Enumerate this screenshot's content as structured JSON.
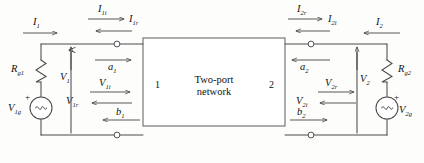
{
  "diagram": {
    "center_block": {
      "line1": "Two-port",
      "line2": "network",
      "port_left": "1",
      "port_right": "2"
    },
    "left_network": {
      "source_label_base": "V",
      "source_label_sub": "1g",
      "source_polarity": "+",
      "resistor_label_base": "R",
      "resistor_label_sub": "g1"
    },
    "right_network": {
      "source_label_base": "V",
      "source_label_sub": "2g",
      "source_polarity": "+",
      "resistor_label_base": "R",
      "resistor_label_sub": "g2"
    },
    "labels": {
      "I1": {
        "base": "I",
        "sub": "1",
        "arrow": "right"
      },
      "I1i": {
        "base": "I",
        "sub": "1i",
        "arrow": "right"
      },
      "I1r": {
        "base": "I",
        "sub": "1r",
        "arrow": "left"
      },
      "I2r": {
        "base": "I",
        "sub": "2r",
        "arrow": "right"
      },
      "I2i": {
        "base": "I",
        "sub": "2i",
        "arrow": "left"
      },
      "I2": {
        "base": "I",
        "sub": "2",
        "arrow": "left"
      },
      "V1": {
        "base": "V",
        "sub": "1",
        "arrow": "up"
      },
      "V1i": {
        "base": "V",
        "sub": "1i",
        "arrow": "right"
      },
      "V1r": {
        "base": "V",
        "sub": "1r",
        "arrow": "left"
      },
      "V2": {
        "base": "V",
        "sub": "2",
        "arrow": "up"
      },
      "V2r": {
        "base": "V",
        "sub": "2r",
        "arrow": "right"
      },
      "V2i": {
        "base": "V",
        "sub": "2i",
        "arrow": "left"
      },
      "a1": {
        "base": "a",
        "sub": "1",
        "arrow": "right"
      },
      "b1": {
        "base": "b",
        "sub": "1",
        "arrow": "left"
      },
      "a2": {
        "base": "a",
        "sub": "2",
        "arrow": "left"
      },
      "b2": {
        "base": "b",
        "sub": "2",
        "arrow": "right"
      }
    },
    "colors": {
      "line": "#444444",
      "text": "#111111",
      "background": "#fdfdfc"
    }
  }
}
